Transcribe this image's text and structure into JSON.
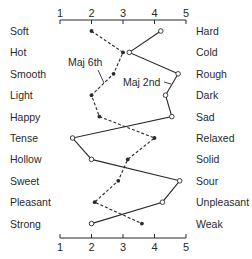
{
  "chart_data": {
    "type": "line",
    "title": "",
    "xlabel": "",
    "ylabel": "",
    "xlim": [
      1,
      5
    ],
    "x_ticks": [
      "1",
      "2",
      "3",
      "4",
      "5"
    ],
    "grid": false,
    "orientation": "horizontal-profile",
    "left_labels": [
      "Soft",
      "Hot",
      "Smooth",
      "Light",
      "Happy",
      "Tense",
      "Hollow",
      "Sweet",
      "Pleasant",
      "Strong"
    ],
    "right_labels": [
      "Hard",
      "Cold",
      "Rough",
      "Dark",
      "Sad",
      "Relaxed",
      "Solid",
      "Sour",
      "Unpleasant",
      "Weak"
    ],
    "series": [
      {
        "name": "Maj 6th",
        "marker": "filled",
        "line_style": "dashed",
        "values": [
          2.0,
          3.0,
          2.7,
          2.0,
          2.25,
          4.0,
          3.15,
          2.85,
          2.1,
          3.6
        ]
      },
      {
        "name": "Maj 2nd",
        "marker": "open",
        "line_style": "solid",
        "values": [
          4.2,
          3.2,
          4.75,
          4.35,
          4.55,
          1.4,
          2.0,
          4.8,
          4.25,
          2.0
        ]
      }
    ],
    "annotations": [
      {
        "text": "Maj 6th",
        "points_to_series": "Maj 6th"
      },
      {
        "text": "Maj 2nd",
        "points_to_series": "Maj 2nd"
      }
    ]
  },
  "colors": {
    "ink": "#2a2a2a",
    "background": "#ffffff"
  }
}
